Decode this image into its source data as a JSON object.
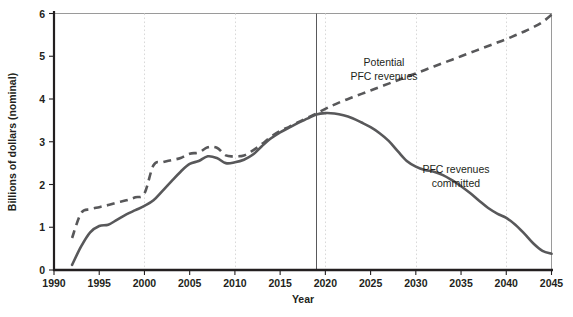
{
  "chart_data": {
    "type": "line",
    "title": "",
    "subtitle": "",
    "xlabel": "Year",
    "ylabel": "Billions of dollars (nominal)",
    "xlim": [
      1990,
      2045
    ],
    "ylim": [
      0,
      6
    ],
    "xticks": [
      1990,
      1995,
      2000,
      2005,
      2010,
      2015,
      2020,
      2025,
      2030,
      2035,
      2040,
      2045
    ],
    "yticks": [
      0,
      1,
      2,
      3,
      4,
      5,
      6
    ],
    "grid": "vertical dotted gridlines at 2000, 2010, 2020, 2030, 2040",
    "legend": "inline annotations",
    "annotations": [
      {
        "text": "Potential\nPFC revenues",
        "line1": "Potential",
        "line2": "PFC revenues",
        "x": 2025.5,
        "y": 4.62
      },
      {
        "text": "PFC revenues\ncommitted",
        "line1": "PFC revenues",
        "line2": "committed",
        "x": 2034.0,
        "y": 2.62
      }
    ],
    "reference_line": {
      "x": 2019,
      "label": ""
    },
    "series": [
      {
        "name": "Potential PFC revenues",
        "style": "dashed",
        "color": "#58585a",
        "x": [
          1992,
          1993,
          1994,
          1995,
          1996,
          1997,
          1998,
          1999,
          2000,
          2001,
          2002,
          2003,
          2004,
          2005,
          2006,
          2007,
          2008,
          2009,
          2010,
          2011,
          2012,
          2013,
          2014,
          2015,
          2016,
          2017,
          2018,
          2019,
          2020,
          2021,
          2022,
          2023,
          2024,
          2025,
          2026,
          2027,
          2028,
          2029,
          2030,
          2031,
          2032,
          2033,
          2034,
          2035,
          2036,
          2037,
          2038,
          2039,
          2040,
          2041,
          2042,
          2043,
          2044,
          2045
        ],
        "y": [
          0.75,
          1.33,
          1.42,
          1.47,
          1.52,
          1.58,
          1.63,
          1.7,
          1.79,
          2.45,
          2.52,
          2.57,
          2.62,
          2.72,
          2.75,
          2.87,
          2.86,
          2.68,
          2.66,
          2.68,
          2.8,
          2.95,
          3.12,
          3.25,
          3.35,
          3.46,
          3.56,
          3.66,
          3.77,
          3.87,
          3.96,
          4.04,
          4.12,
          4.2,
          4.28,
          4.36,
          4.44,
          4.52,
          4.6,
          4.68,
          4.76,
          4.84,
          4.92,
          5.0,
          5.08,
          5.16,
          5.24,
          5.32,
          5.4,
          5.49,
          5.58,
          5.68,
          5.8,
          5.97
        ]
      },
      {
        "name": "PFC revenues committed",
        "style": "solid",
        "color": "#58585a",
        "x": [
          1992,
          1993,
          1994,
          1995,
          1996,
          1997,
          1998,
          1999,
          2000,
          2001,
          2002,
          2003,
          2004,
          2005,
          2006,
          2007,
          2008,
          2009,
          2010,
          2011,
          2012,
          2013,
          2014,
          2015,
          2016,
          2017,
          2018,
          2019,
          2020,
          2021,
          2022,
          2023,
          2024,
          2025,
          2026,
          2027,
          2028,
          2029,
          2030,
          2031,
          2032,
          2033,
          2034,
          2035,
          2036,
          2037,
          2038,
          2039,
          2040,
          2041,
          2042,
          2043,
          2044,
          2045
        ],
        "y": [
          0.12,
          0.55,
          0.88,
          1.03,
          1.06,
          1.18,
          1.3,
          1.4,
          1.5,
          1.63,
          1.85,
          2.08,
          2.3,
          2.48,
          2.55,
          2.66,
          2.62,
          2.5,
          2.52,
          2.58,
          2.7,
          2.9,
          3.08,
          3.22,
          3.33,
          3.44,
          3.54,
          3.64,
          3.67,
          3.66,
          3.62,
          3.55,
          3.45,
          3.34,
          3.2,
          3.02,
          2.78,
          2.55,
          2.42,
          2.34,
          2.3,
          2.22,
          2.1,
          1.96,
          1.8,
          1.62,
          1.45,
          1.32,
          1.22,
          1.06,
          0.85,
          0.62,
          0.45,
          0.38
        ]
      }
    ]
  },
  "axes": {
    "y_title": "Billions of dollars (nominal)",
    "x_title": "Year",
    "y_tick_labels": [
      "0",
      "1",
      "2",
      "3",
      "4",
      "5",
      "6"
    ],
    "x_tick_labels": [
      "1990",
      "1995",
      "2000",
      "2005",
      "2010",
      "2015",
      "2020",
      "2025",
      "2030",
      "2035",
      "2040",
      "2045"
    ]
  },
  "labels": {
    "potential_line1": "Potential",
    "potential_line2": "PFC revenues",
    "committed_line1": "PFC revenues",
    "committed_line2": "committed"
  },
  "colors": {
    "series": "#58585a",
    "axis": "#231f20",
    "grid": "#d9d9d9",
    "frame": "#9a9a9a",
    "reference": "#59595b",
    "background": "#ffffff"
  }
}
